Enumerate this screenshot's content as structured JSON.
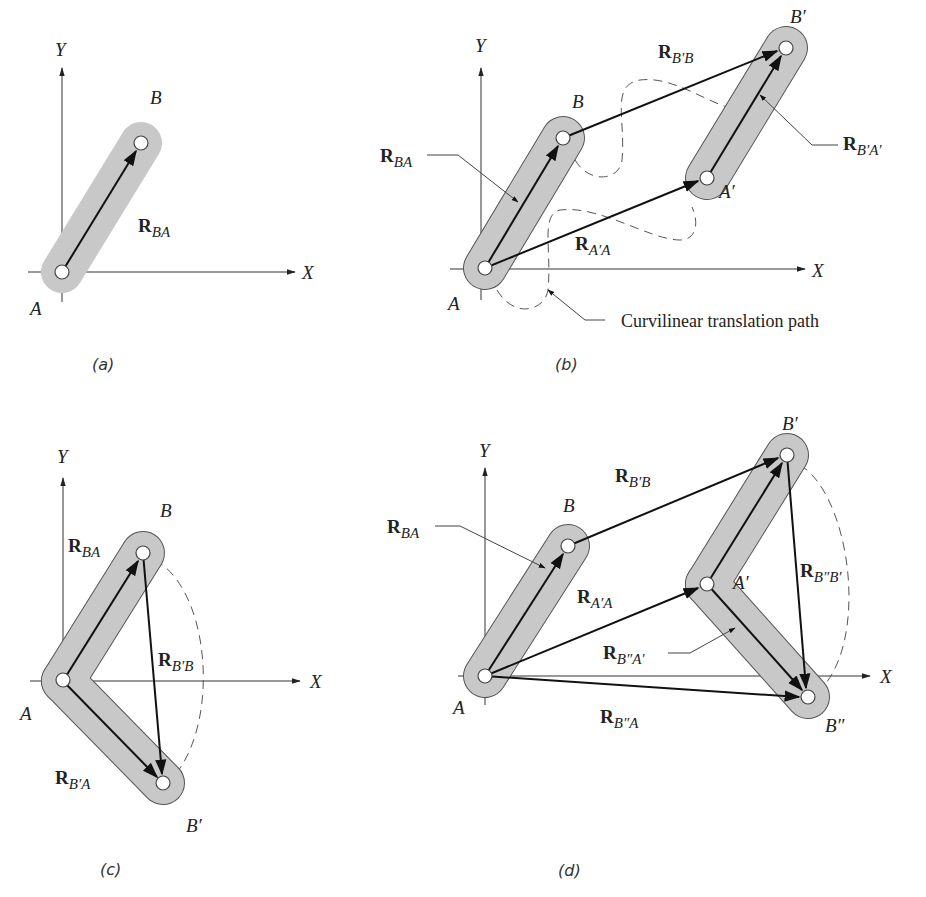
{
  "figure": {
    "panels": [
      {
        "id": "a",
        "caption": "(a)",
        "axes": {
          "x_label": "X",
          "y_label": "Y"
        },
        "points": {
          "A": "A",
          "B": "B"
        },
        "vectors": [
          {
            "main": "R",
            "sub": "BA"
          }
        ]
      },
      {
        "id": "b",
        "caption": "(b)",
        "axes": {
          "x_label": "X",
          "y_label": "Y"
        },
        "points": {
          "A": "A",
          "B": "B",
          "A_prime": "A′",
          "B_prime": "B′"
        },
        "vectors": [
          {
            "main": "R",
            "sub": "BA"
          },
          {
            "main": "R",
            "sub": "B′B"
          },
          {
            "main": "R",
            "sub": "B′A′"
          },
          {
            "main": "R",
            "sub": "A′A"
          }
        ],
        "annotation": "Curvilinear translation path"
      },
      {
        "id": "c",
        "caption": "(c)",
        "axes": {
          "x_label": "X",
          "y_label": "Y"
        },
        "points": {
          "A": "A",
          "B": "B",
          "B_prime": "B′"
        },
        "vectors": [
          {
            "main": "R",
            "sub": "BA"
          },
          {
            "main": "R",
            "sub": "B′B"
          },
          {
            "main": "R",
            "sub": "B′A"
          }
        ]
      },
      {
        "id": "d",
        "caption": "(d)",
        "axes": {
          "x_label": "X",
          "y_label": "Y"
        },
        "points": {
          "A": "A",
          "B": "B",
          "A_prime": "A′",
          "B_prime": "B′",
          "B_dprime": "B″"
        },
        "vectors": [
          {
            "main": "R",
            "sub": "BA"
          },
          {
            "main": "R",
            "sub": "B′B"
          },
          {
            "main": "R",
            "sub": "A′A"
          },
          {
            "main": "R",
            "sub": "B″B′"
          },
          {
            "main": "R",
            "sub": "B″A′"
          },
          {
            "main": "R",
            "sub": "B″A"
          }
        ]
      }
    ]
  }
}
